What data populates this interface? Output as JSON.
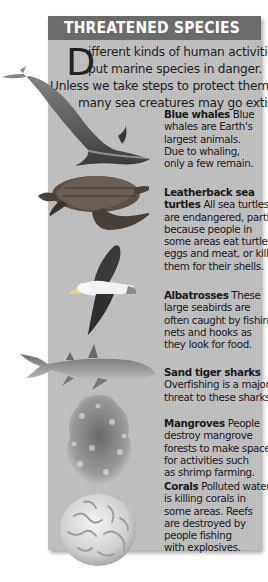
{
  "header": {
    "title": "THREATENED SPECIES"
  },
  "intro": {
    "dropcap": "D",
    "lines": [
      "ifferent kinds of human activities",
      "put marine species in danger.",
      "Unless we take steps to protect them,",
      "many sea creatures may go extinct."
    ]
  },
  "entries": [
    {
      "name": "Blue whales",
      "lines": [
        "Blue",
        "whales are Earth's",
        "largest animals.",
        "Due to whaling,",
        "only a few remain."
      ],
      "icon": "blue-whale-image"
    },
    {
      "name": "Leatherback sea",
      "lines": [
        "turtles All sea turtles",
        "are endangered, partly",
        "because people in",
        "some areas eat turtle",
        "eggs and meat, or kill",
        "them for their shells."
      ],
      "name2": "turtles",
      "icon": "sea-turtle-image"
    },
    {
      "name": "Albatrosses",
      "lines": [
        "These",
        "large seabirds are",
        "often caught by fishing",
        "nets and hooks as",
        "they look for food."
      ],
      "icon": "albatross-image"
    },
    {
      "name": "Sand tiger sharks",
      "lines": [
        "Overfishing is a major",
        "threat to these sharks."
      ],
      "icon": "shark-image"
    },
    {
      "name": "Mangroves",
      "lines": [
        "People",
        "destroy mangrove",
        "forests to make space",
        "for activities such",
        "as shrimp farming."
      ],
      "icon": "mangrove-image"
    },
    {
      "name": "Corals",
      "lines": [
        "Polluted water",
        "is killing corals in",
        "some areas. Reefs",
        "are destroyed by",
        "people fishing",
        "with explosives."
      ],
      "icon": "coral-image"
    }
  ],
  "colors": {
    "header_bg": "#6b6b6b",
    "panel_bg": "#bdbdbd",
    "text": "#1a1a1a"
  }
}
